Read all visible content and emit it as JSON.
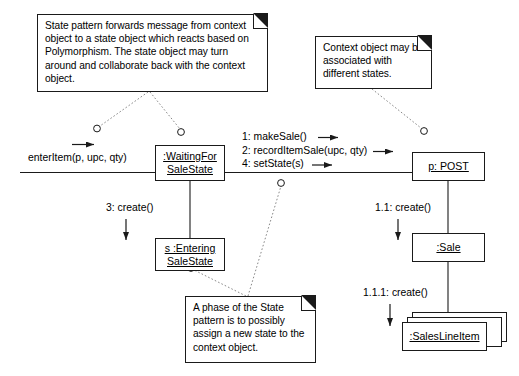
{
  "diagram": {
    "stroke_color": "#1a1a1a",
    "background_color": "#ffffff"
  },
  "notes": [
    {
      "id": "note-state-pattern",
      "text": "State pattern forwards message from context object to a state object which reacts based on Polymorphism. The state object may turn around and collaborate back with the context object."
    },
    {
      "id": "note-context-object",
      "text": "Context object may be associated with different states."
    },
    {
      "id": "note-phase-of-state",
      "text": "A phase of the State pattern is to possibly assign a new state to the context object."
    }
  ],
  "objects": [
    {
      "id": "waiting-for-sale-state",
      "line1": ":WaitingFor",
      "line2": "SaleState"
    },
    {
      "id": "post",
      "line1": "p: POST",
      "line2": ""
    },
    {
      "id": "entering-sale-state",
      "line1": "s :Entering",
      "line2": "SaleState"
    },
    {
      "id": "sale",
      "line1": ":Sale",
      "line2": ""
    },
    {
      "id": "sales-line-item",
      "line1": ":SalesLineItem",
      "line2": ""
    }
  ],
  "messages": [
    {
      "id": "enter-item",
      "text": "enterItem(p, upc, qty)"
    },
    {
      "id": "make-sale",
      "text": "1: makeSale()"
    },
    {
      "id": "record-item-sale",
      "text": "2: recordItemSale(upc, qty)"
    },
    {
      "id": "set-state",
      "text": "4: setState(s)"
    },
    {
      "id": "create-entering-state",
      "text": "3: create()"
    },
    {
      "id": "create-sale",
      "text": "1.1: create()"
    },
    {
      "id": "create-sales-line-item",
      "text": "1.1.1: create()"
    }
  ]
}
